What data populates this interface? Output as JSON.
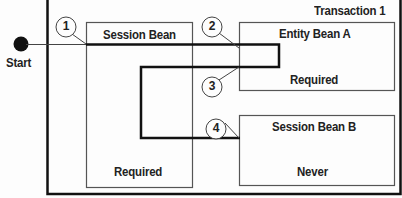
{
  "diagram": {
    "container": {
      "label": "Transaction 1"
    },
    "start": {
      "label": "Start"
    },
    "beans": [
      {
        "name": "Session Bean",
        "attribute": "Required"
      },
      {
        "name": "Entity Bean A",
        "attribute": "Required"
      },
      {
        "name": "Session Bean B",
        "attribute": "Never"
      }
    ],
    "steps": [
      "1",
      "2",
      "3",
      "4"
    ]
  }
}
